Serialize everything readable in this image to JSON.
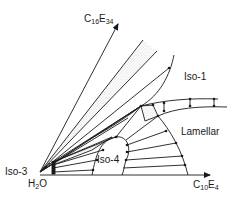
{
  "diagram": {
    "type": "ternary-phase-diagram",
    "components": {
      "origin": {
        "name": "H2O",
        "base": "H",
        "sub": "2",
        "tail": "O"
      },
      "upper_axis": {
        "name": "C16E34",
        "a": "C",
        "a_sub": "16",
        "b": "E",
        "b_sub": "34"
      },
      "right_axis": {
        "name": "C10E4",
        "a": "C",
        "a_sub": "10",
        "b": "E",
        "b_sub": "4"
      }
    },
    "phases": [
      {
        "id": "iso-1",
        "label": "Iso-1"
      },
      {
        "id": "lamellar",
        "label": "Lamellar"
      },
      {
        "id": "iso-4",
        "label": "Iso-4"
      },
      {
        "id": "iso-3",
        "label": "Iso-3"
      }
    ],
    "features": {
      "stippled_band": "two-phase region between upper axis and Iso-1 boundary",
      "tie_lines": true,
      "three_phase_triangles": true
    },
    "colors": {
      "ink": "#1a1a1a",
      "background": "#ffffff",
      "stipple": "#9a9a9a"
    }
  }
}
